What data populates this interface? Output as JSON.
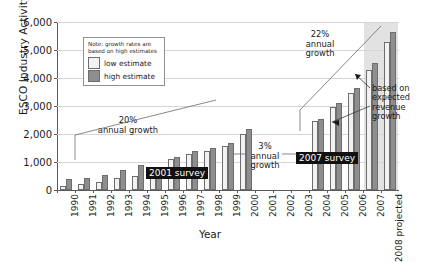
{
  "chart_data": {
    "type": "bar",
    "title": "",
    "xlabel": "Year",
    "ylabel": "ESCO Industry Activity ($M)",
    "ylim": [
      0,
      6000
    ],
    "ytick_values": [
      0,
      1000,
      2000,
      3000,
      4000,
      5000,
      6000
    ],
    "ytick_labels": [
      "0",
      "1,000",
      "2,000",
      "3,000",
      "4,000",
      "5,000",
      "6,000"
    ],
    "grid": true,
    "legend_position": "upper-left-inset",
    "categories": [
      "1990",
      "1991",
      "1992",
      "1993",
      "1994",
      "1995",
      "1996",
      "1997",
      "1998",
      "1999",
      "2000",
      "2001",
      "2002",
      "2003",
      "2004",
      "2005",
      "2006",
      "2007",
      "2008"
    ],
    "projected_categories": [
      "2007",
      "2008"
    ],
    "projected_label": "projected",
    "series": [
      {
        "name": "low estimate",
        "color": "#f2f2f2",
        "values": [
          160,
          220,
          300,
          420,
          500,
          700,
          1100,
          1280,
          1400,
          1580,
          2000,
          null,
          null,
          null,
          2450,
          2950,
          3480,
          4300,
          5300
        ]
      },
      {
        "name": "high estimate",
        "color": "#8e8e8e",
        "values": [
          380,
          440,
          540,
          710,
          900,
          750,
          1170,
          1400,
          1510,
          1680,
          2180,
          null,
          null,
          null,
          2550,
          3100,
          3640,
          4550,
          5650
        ]
      }
    ],
    "annotations": [
      {
        "id": "growth-20",
        "text": "20%\nannual growth"
      },
      {
        "id": "growth-3",
        "text": "3%\nannual\ngrowth"
      },
      {
        "id": "growth-22",
        "text": "22%\nannual\ngrowth"
      },
      {
        "id": "based-on",
        "text": "based on\nexpected\nrevenue\ngrowth"
      },
      {
        "id": "survey-2001",
        "text": "2001 survey"
      },
      {
        "id": "survey-2007",
        "text": "2007 survey"
      }
    ]
  },
  "legend": {
    "note": "Note: growth rates are based on high estimates",
    "items": [
      {
        "label": "low estimate",
        "swatch": "low"
      },
      {
        "label": "high estimate",
        "swatch": "high"
      }
    ]
  },
  "annotations": {
    "growth_20": "20%\nannual growth",
    "growth_3": "3%\nannual\ngrowth",
    "growth_22": "22%\nannual\ngrowth",
    "based_on": "based on\nexpected\nrevenue\ngrowth",
    "survey_2001": "2001 survey",
    "survey_2007": "2007 survey"
  },
  "colors": {
    "low_estimate": "#f2f2f2",
    "high_estimate": "#8e8e8e",
    "gridline": "#d5d5d5",
    "axis": "#5a5a5a",
    "projected_band": "#e2e2e2",
    "tag_background": "#111111"
  }
}
